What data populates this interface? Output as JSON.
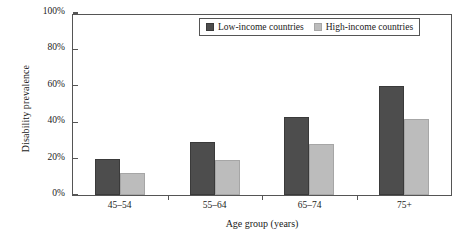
{
  "chart_data": {
    "type": "bar",
    "title": "",
    "subtitle": "",
    "xlabel": "Age group (years)",
    "ylabel": "Disability prevalence",
    "categories": [
      "45–54",
      "55–64",
      "65–74",
      "75+"
    ],
    "series": [
      {
        "name": "Low-income countries",
        "values": [
          20,
          29,
          43,
          60
        ],
        "color": "#4d4d4d"
      },
      {
        "name": "High-income countries",
        "values": [
          12,
          19,
          28,
          42
        ],
        "color": "#bcbcbc"
      }
    ],
    "ylim": [
      0,
      100
    ],
    "ytick_values": [
      0,
      20,
      40,
      60,
      80,
      100
    ],
    "ytick_labels": [
      "0%",
      "20%",
      "40%",
      "60%",
      "80%",
      "100%"
    ],
    "grid": false,
    "legend_position": "top-right-inside",
    "value_unit": "percent"
  },
  "legend": {
    "items": [
      {
        "label": "Low-income countries"
      },
      {
        "label": "High-income countries"
      }
    ]
  }
}
